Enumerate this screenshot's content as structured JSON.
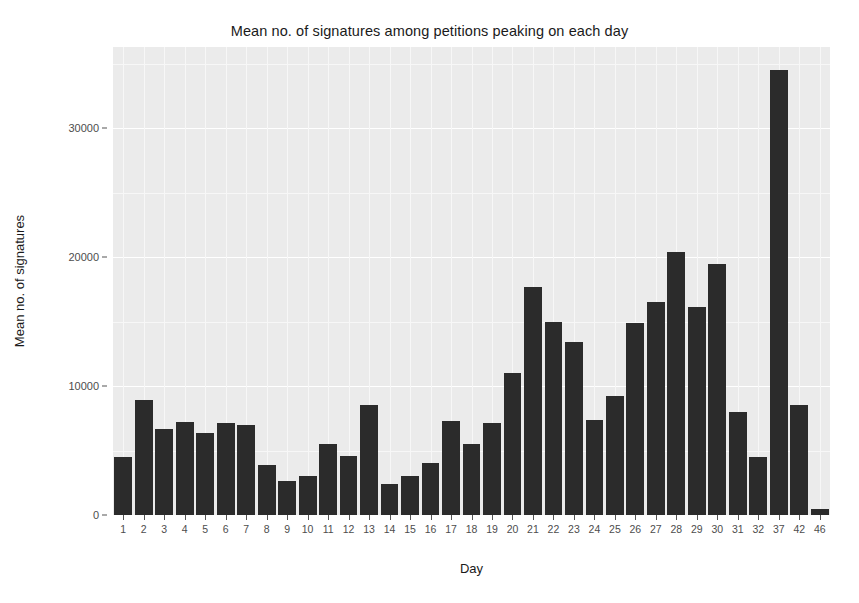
{
  "chart_data": {
    "type": "bar",
    "title": "Mean no. of signatures among petitions peaking on each day",
    "xlabel": "Day",
    "ylabel": "Mean no. of signatures",
    "categories": [
      "1",
      "2",
      "3",
      "4",
      "5",
      "6",
      "7",
      "8",
      "9",
      "10",
      "11",
      "12",
      "13",
      "14",
      "15",
      "16",
      "17",
      "18",
      "19",
      "20",
      "21",
      "22",
      "23",
      "24",
      "25",
      "26",
      "27",
      "28",
      "29",
      "30",
      "31",
      "32",
      "37",
      "42",
      "46"
    ],
    "values": [
      4500,
      8900,
      6700,
      7200,
      6400,
      7100,
      7000,
      3900,
      2600,
      3000,
      5500,
      4600,
      8500,
      2400,
      3000,
      4000,
      7300,
      5500,
      7100,
      11000,
      17700,
      15000,
      13400,
      7400,
      9200,
      14900,
      16500,
      20400,
      16100,
      19500,
      8000,
      4500,
      34500,
      8500,
      500
    ],
    "ytick_labels": [
      "0",
      "10000",
      "20000",
      "30000"
    ],
    "ytick_values": [
      0,
      10000,
      20000,
      30000
    ],
    "ylim": [
      0,
      36300
    ],
    "grid": true,
    "legend": "none",
    "bar_color": "#2b2b2b",
    "panel_color": "#ebebeb",
    "grid_color": "#ffffff"
  }
}
